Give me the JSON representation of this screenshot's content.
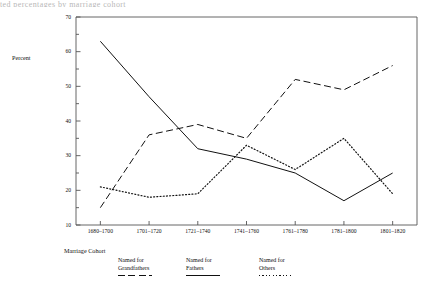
{
  "figure": {
    "cut_title": "ted percentages by marriage cohort",
    "axis_color": "#555555"
  },
  "axes": {
    "ylabel": "Percent",
    "xlabel": "Marriage Cohort",
    "ytick_labels": [
      "10",
      "20",
      "30",
      "40",
      "50",
      "60",
      "70"
    ],
    "xtick_labels": [
      "1680–1700",
      "1701–1720",
      "1721–1740",
      "1741–1760",
      "1761–1780",
      "1781–1800",
      "1801–1820"
    ]
  },
  "legend": {
    "items": [
      {
        "line1": "Named for",
        "line2": "Grandfathers",
        "style": "dashed"
      },
      {
        "line1": "Named for",
        "line2": "Fathers",
        "style": "solid"
      },
      {
        "line1": "Named for",
        "line2": "Others",
        "style": "dotted"
      }
    ]
  },
  "chart_data": {
    "type": "line",
    "title": "",
    "xlabel": "Marriage Cohort",
    "ylabel": "Percent",
    "ylim": [
      10,
      70
    ],
    "ytick_step": 10,
    "yminor_step": 5,
    "grid": false,
    "legend_position": "below-axes",
    "categories": [
      "1680–1700",
      "1701–1720",
      "1721–1740",
      "1741–1760",
      "1761–1780",
      "1781–1800",
      "1801–1820"
    ],
    "series": [
      {
        "name": "Named for Grandfathers",
        "style": "dashed",
        "values": [
          15,
          36,
          39,
          35,
          52,
          49,
          56
        ]
      },
      {
        "name": "Named for Fathers",
        "style": "solid",
        "values": [
          63,
          47,
          32,
          29,
          25,
          17,
          25
        ]
      },
      {
        "name": "Named for Others",
        "style": "dotted",
        "values": [
          21,
          18,
          19,
          33,
          26,
          35,
          19
        ]
      }
    ]
  }
}
